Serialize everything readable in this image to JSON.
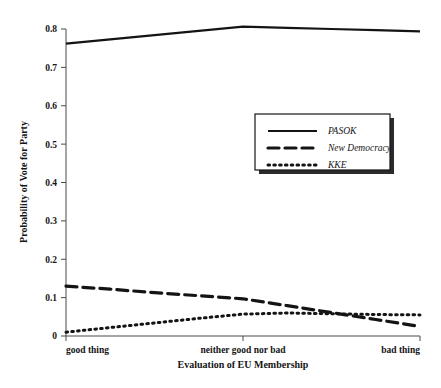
{
  "chart_data": {
    "type": "line",
    "title": "",
    "xlabel": "Evaluation of EU Membership",
    "ylabel": "Probability of Vote for Party",
    "categories": [
      "good thing",
      "neither good nor bad",
      "bad thing"
    ],
    "x": [
      0,
      0.5,
      1
    ],
    "xlim": [
      0,
      1
    ],
    "ylim": [
      0,
      0.8
    ],
    "grid": false,
    "legend_position": "center-right",
    "ytick_labels": [
      "0",
      "0.1",
      "0.2",
      "0.3",
      "0.4",
      "0.5",
      "0.6",
      "0.7",
      "0.8"
    ],
    "ytick_values": [
      0,
      0.1,
      0.2,
      0.3,
      0.4,
      0.5,
      0.6,
      0.7,
      0.8
    ],
    "series": [
      {
        "name": "PASOK",
        "style": "solid",
        "x": [
          0,
          0.125,
          0.25,
          0.375,
          0.5,
          0.625,
          0.75,
          0.875,
          1
        ],
        "values": [
          0.762,
          0.773,
          0.784,
          0.795,
          0.806,
          0.803,
          0.8,
          0.797,
          0.794
        ]
      },
      {
        "name": "New Democracy",
        "style": "dashed",
        "x": [
          0,
          0.125,
          0.25,
          0.375,
          0.5,
          0.625,
          0.75,
          0.875,
          1
        ],
        "values": [
          0.13,
          0.122,
          0.113,
          0.105,
          0.097,
          0.079,
          0.061,
          0.043,
          0.025
        ]
      },
      {
        "name": "KKE",
        "style": "dotted",
        "x": [
          0,
          0.125,
          0.25,
          0.375,
          0.5,
          0.625,
          0.75,
          0.875,
          1
        ],
        "values": [
          0.01,
          0.022,
          0.034,
          0.046,
          0.057,
          0.06,
          0.058,
          0.056,
          0.055
        ]
      }
    ]
  },
  "axes": {
    "y_label": "Probability of Vote for Party",
    "x_label": "Evaluation of EU Membership"
  },
  "legend": {
    "entries": [
      {
        "label": "PASOK",
        "style": "solid"
      },
      {
        "label": "New Democracy",
        "style": "dashed"
      },
      {
        "label": "KKE",
        "style": "dotted"
      }
    ]
  }
}
